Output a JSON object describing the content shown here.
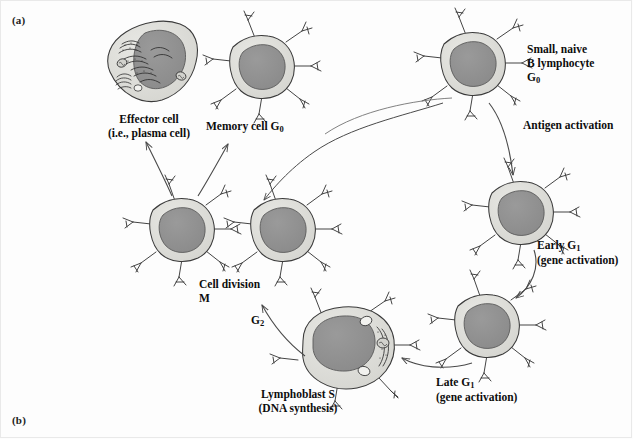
{
  "figure": {
    "panel_a_label": "(a)",
    "panel_b_label": "(b)",
    "background_color": "#fdfdfd",
    "cell_cytoplasm_color": "#dcdcd8",
    "cell_nucleus_color": "#8f8f8f",
    "outline_color": "#3a3a3a",
    "arrow_color": "#4a4a4a"
  },
  "labels": {
    "effector_cell_line1": "Effector cell",
    "effector_cell_line2": "(i.e., plasma cell)",
    "memory_cell": "Memory cell G",
    "memory_cell_sub": "0",
    "small_naive_line1": "Small, naive",
    "small_naive_line2": "B lymphocyte",
    "small_naive_line3": "G",
    "small_naive_sub": "0",
    "antigen_activation": "Antigen activation",
    "early_g1_line1": "Early G",
    "early_g1_sub": "1",
    "early_g1_line2": "(gene activation)",
    "late_g1_line1": "Late G",
    "late_g1_sub": "1",
    "late_g1_line2": "(gene activation)",
    "lymphoblast_line1": "Lymphoblast S",
    "lymphoblast_line2": "(DNA synthesis)",
    "g2_phase": "G",
    "g2_phase_sub": "2",
    "cell_division_line1": "Cell division",
    "cell_division_line2": "M"
  },
  "cells": [
    {
      "id": "effector-cell",
      "name": "Effector cell (plasma cell)",
      "cx": 145,
      "cy": 62,
      "has_organelles": true,
      "receptors": 0
    },
    {
      "id": "memory-cell",
      "name": "Memory cell G0",
      "cx": 262,
      "cy": 66,
      "has_organelles": false,
      "receptors": 7
    },
    {
      "id": "naive-b-cell",
      "name": "Small naive B lymphocyte G0",
      "cx": 473,
      "cy": 63,
      "has_organelles": false,
      "receptors": 7
    },
    {
      "id": "early-g1-cell",
      "name": "Early G1 cell",
      "cx": 521,
      "cy": 212,
      "has_organelles": false,
      "receptors": 7
    },
    {
      "id": "late-g1-cell",
      "name": "Late G1 cell",
      "cx": 487,
      "cy": 325,
      "has_organelles": false,
      "receptors": 7
    },
    {
      "id": "lymphoblast-cell",
      "name": "Lymphoblast S cell",
      "cx": 344,
      "cy": 347,
      "has_organelles": true,
      "receptors": 7
    },
    {
      "id": "daughter-cell-left",
      "name": "Daughter cell left",
      "cx": 182,
      "cy": 229,
      "has_organelles": false,
      "receptors": 7
    },
    {
      "id": "daughter-cell-right",
      "name": "Daughter cell right",
      "cx": 283,
      "cy": 229,
      "has_organelles": false,
      "receptors": 7
    }
  ]
}
